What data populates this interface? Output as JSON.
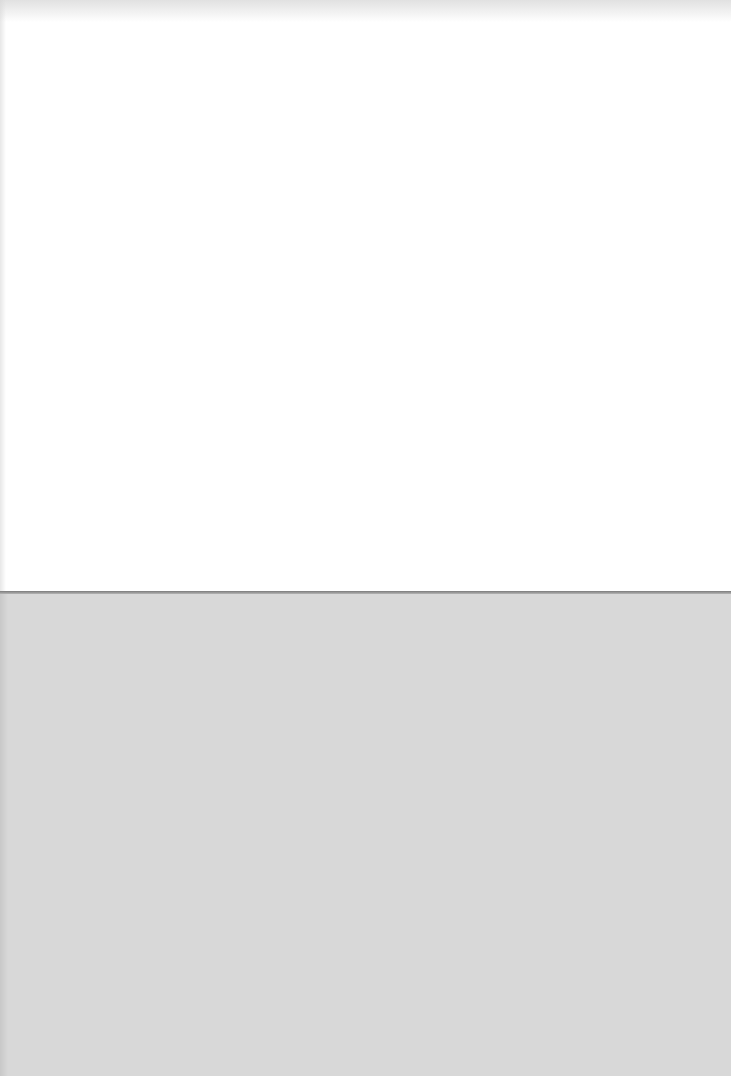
{
  "document": {
    "page": {
      "text": "",
      "background_color": "#ffffff",
      "height_px": 591
    },
    "backing_sheet": {
      "background_color": "#d8d8d8"
    },
    "colors": {
      "page": "#ffffff",
      "backing": "#d8d8d8",
      "page_edge": "#7a7a7a"
    }
  }
}
